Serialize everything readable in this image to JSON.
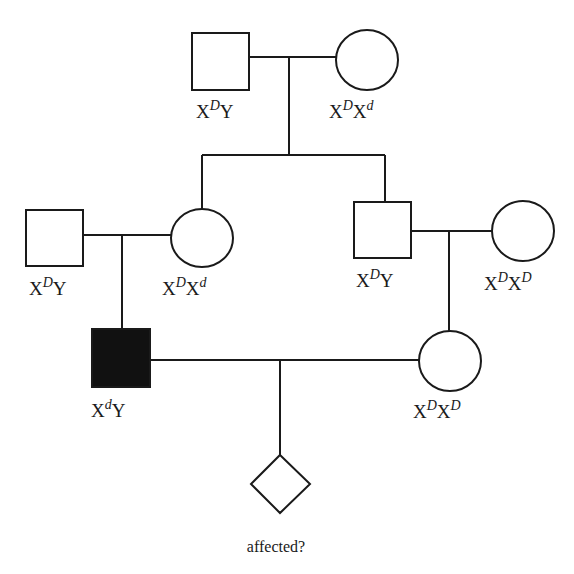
{
  "diagram": {
    "type": "pedigree",
    "individuals": [
      {
        "id": "gen1-father",
        "sex": "male",
        "affected": false,
        "genotype": {
          "base1": "X",
          "sup1": "D",
          "base2": "Y",
          "sup2": ""
        }
      },
      {
        "id": "gen1-mother",
        "sex": "female",
        "affected": false,
        "genotype": {
          "base1": "X",
          "sup1": "D",
          "base2": "X",
          "sup2": "d"
        }
      },
      {
        "id": "gen2-left-husband",
        "sex": "male",
        "affected": false,
        "genotype": {
          "base1": "X",
          "sup1": "D",
          "base2": "Y",
          "sup2": ""
        }
      },
      {
        "id": "gen2-daughter",
        "sex": "female",
        "affected": false,
        "genotype": {
          "base1": "X",
          "sup1": "D",
          "base2": "X",
          "sup2": "d"
        }
      },
      {
        "id": "gen2-son",
        "sex": "male",
        "affected": false,
        "genotype": {
          "base1": "X",
          "sup1": "D",
          "base2": "Y",
          "sup2": ""
        }
      },
      {
        "id": "gen2-right-wife",
        "sex": "female",
        "affected": false,
        "genotype": {
          "base1": "X",
          "sup1": "D",
          "base2": "X",
          "sup2": "D"
        }
      },
      {
        "id": "gen3-affected-male",
        "sex": "male",
        "affected": true,
        "genotype": {
          "base1": "X",
          "sup1": "d",
          "base2": "Y",
          "sup2": ""
        }
      },
      {
        "id": "gen3-female",
        "sex": "female",
        "affected": false,
        "genotype": {
          "base1": "X",
          "sup1": "D",
          "base2": "X",
          "sup2": "D"
        }
      },
      {
        "id": "gen4-child",
        "sex": "unknown",
        "affected": null,
        "caption": "affected?"
      }
    ],
    "colors": {
      "line": "#1a1a1a",
      "affected_fill": "#111111",
      "unaffected_fill": "#ffffff",
      "background": "#ffffff"
    }
  }
}
